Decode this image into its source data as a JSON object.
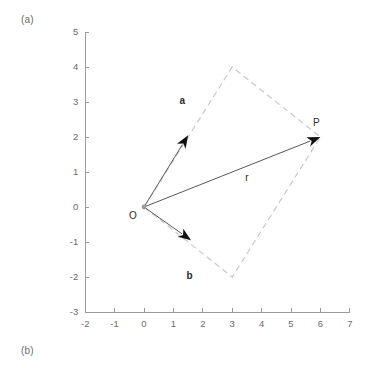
{
  "figure": {
    "panel_a_label": "(a)",
    "panel_b_label": "(b)"
  },
  "chart_data": {
    "type": "scatter",
    "title": "",
    "xlabel": "",
    "ylabel": "",
    "xlim": [
      -2,
      7
    ],
    "ylim": [
      -3,
      5
    ],
    "grid": false,
    "legend": "none",
    "x_ticks": [
      "-2",
      "-1",
      "0",
      "1",
      "2",
      "3",
      "4",
      "5",
      "6",
      "7"
    ],
    "x_tick_values": [
      -2,
      -1,
      0,
      1,
      2,
      3,
      4,
      5,
      6,
      7
    ],
    "y_ticks": [
      "5",
      "4",
      "3",
      "2",
      "1",
      "0",
      "-1",
      "-2",
      "-3"
    ],
    "y_tick_values": [
      5,
      4,
      3,
      2,
      1,
      0,
      -1,
      -2,
      -3
    ],
    "points": [
      {
        "name": "O",
        "label": "O",
        "x": 0,
        "y": 0
      },
      {
        "name": "P",
        "label": "P",
        "x": 6,
        "y": 2
      }
    ],
    "vectors": [
      {
        "name": "a",
        "label": "a",
        "from": [
          0,
          0
        ],
        "to": [
          1.5,
          2.05
        ],
        "label_at": [
          1.3,
          2.95
        ],
        "style": "solid-arrow"
      },
      {
        "name": "b",
        "label": "b",
        "from": [
          0,
          0
        ],
        "to": [
          1.6,
          -0.95
        ],
        "label_at": [
          1.55,
          -2.05
        ],
        "style": "solid-arrow"
      },
      {
        "name": "r",
        "label": "r",
        "from": [
          0,
          0
        ],
        "to": [
          6,
          2
        ],
        "label_at": [
          3.5,
          0.75
        ],
        "style": "solid-arrow"
      }
    ],
    "parallelogram": {
      "name": "parallelogram-oapb",
      "vertices": [
        [
          0,
          0
        ],
        [
          3,
          4
        ],
        [
          6,
          2
        ],
        [
          3,
          -2
        ]
      ],
      "style": "dashed",
      "color": "#c9c9c9"
    },
    "colors": {
      "axis": "#9a9a9a",
      "tick_text": "#6b6b6b",
      "vector": "#58585a",
      "arrow_head": "#111111",
      "dashed": "#c9c9c9",
      "background": "#ffffff"
    }
  }
}
